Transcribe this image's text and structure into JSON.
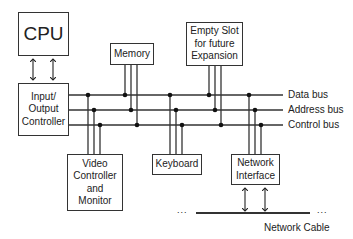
{
  "diagram": {
    "components": {
      "cpu": {
        "label": "CPU"
      },
      "io_controller": {
        "lines": [
          "Input/",
          "Output",
          "Controller"
        ]
      },
      "memory": {
        "label": "Memory"
      },
      "expansion": {
        "lines": [
          "Empty Slot",
          "for future",
          "Expansion"
        ]
      },
      "video": {
        "lines": [
          "Video",
          "Controller",
          "and",
          "Monitor"
        ]
      },
      "keyboard": {
        "label": "Keyboard"
      },
      "network_interface": {
        "lines": [
          "Network",
          "Interface"
        ]
      }
    },
    "buses": [
      {
        "label": "Data bus"
      },
      {
        "label": "Address bus"
      },
      {
        "label": "Control bus"
      }
    ],
    "network_cable": {
      "label": "Network Cable",
      "ellipsis": "..."
    },
    "colors": {
      "line": "#333333",
      "background": "#ffffff"
    }
  }
}
